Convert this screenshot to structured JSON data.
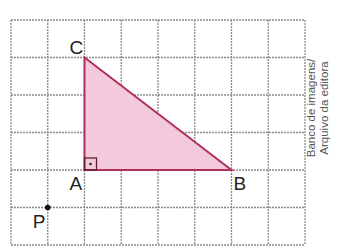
{
  "figure": {
    "grid": {
      "columns": 8,
      "rows": 6,
      "origin_x": 11,
      "origin_y": 20,
      "cell_w": 36.75,
      "cell_h": 37.5,
      "line_color": "#8a8a8a"
    },
    "triangle": {
      "vertices": {
        "A": {
          "col": 2,
          "row": 4
        },
        "B": {
          "col": 6,
          "row": 4
        },
        "C": {
          "col": 2,
          "row": 1
        }
      },
      "fill_color": "#f2cadb",
      "stroke_color": "#b03060",
      "right_angle_at": "A"
    },
    "points": {
      "P": {
        "col": 1,
        "row": 5,
        "color": "#111111"
      }
    },
    "labels": {
      "A": "A",
      "B": "B",
      "C": "C",
      "P": "P"
    },
    "credit": {
      "line1": "Banco de imagens/",
      "line2": "Arquivo da editora"
    }
  }
}
